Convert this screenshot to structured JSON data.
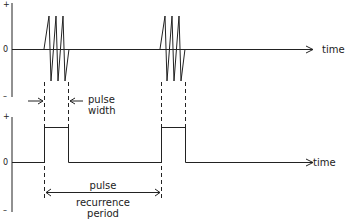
{
  "top_plot": {
    "y_plus": "+",
    "y_zero": "0",
    "y_minus": "–",
    "x_label": "time"
  },
  "bottom_plot": {
    "y_plus": "+",
    "y_zero": "0",
    "y_minus": "–",
    "x_label": "time"
  },
  "annotations": {
    "pulse_width_line1": "pulse",
    "pulse_width_line2": "width",
    "prp_line1": "pulse",
    "prp_line2": "recurrence",
    "prp_line3": "period"
  },
  "colors": {
    "ink": "#222222",
    "background": "#ffffff"
  }
}
